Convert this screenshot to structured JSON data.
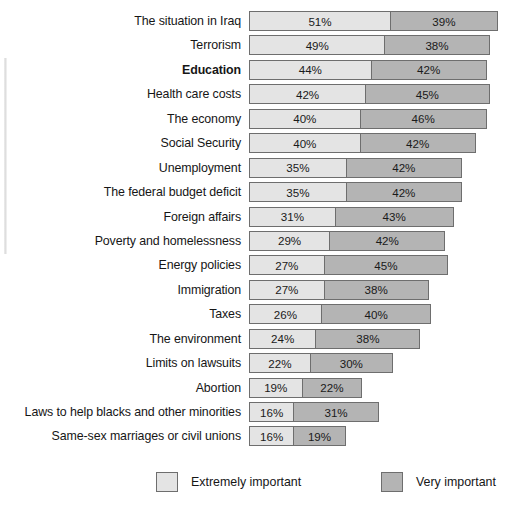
{
  "chart_data": {
    "type": "bar",
    "orientation": "horizontal",
    "stacked": true,
    "title": "",
    "subtitle": "",
    "xlabel": "",
    "ylabel": "",
    "grid": false,
    "legend_position": "bottom",
    "value_suffix": "%",
    "xlim": [
      0,
      95
    ],
    "px_per_percent": 2.765,
    "categories": [
      "The situation in Iraq",
      "Terrorism",
      "Education",
      "Health care costs",
      "The economy",
      "Social Security",
      "Unemployment",
      "The federal budget deficit",
      "Foreign affairs",
      "Poverty and homelessness",
      "Energy policies",
      "Immigration",
      "Taxes",
      "The environment",
      "Limits on lawsuits",
      "Abortion",
      "Laws to help blacks and other minorities",
      "Same-sex marriages or civil unions"
    ],
    "emphasized_category": "Education",
    "series": [
      {
        "name": "Extremely important",
        "color": "#e4e4e4",
        "values": [
          51,
          49,
          44,
          42,
          40,
          40,
          35,
          35,
          31,
          29,
          27,
          27,
          26,
          24,
          22,
          19,
          16,
          16
        ],
        "labels": [
          "51%",
          "49%",
          "44%",
          "42%",
          "40%",
          "40%",
          "35%",
          "35%",
          "31%",
          "29%",
          "27%",
          "27%",
          "26%",
          "24%",
          "22%",
          "19%",
          "16%",
          "16%"
        ]
      },
      {
        "name": "Very important",
        "color": "#b4b4b4",
        "values": [
          39,
          38,
          42,
          45,
          46,
          42,
          42,
          42,
          43,
          42,
          45,
          38,
          40,
          38,
          30,
          22,
          31,
          19
        ],
        "labels": [
          "39%",
          "38%",
          "42%",
          "45%",
          "46%",
          "42%",
          "42%",
          "42%",
          "43%",
          "42%",
          "45%",
          "38%",
          "40%",
          "38%",
          "30%",
          "22%",
          "31%",
          "19%"
        ]
      }
    ],
    "totals": [
      90,
      87,
      86,
      87,
      86,
      82,
      77,
      77,
      74,
      71,
      72,
      65,
      66,
      62,
      52,
      41,
      47,
      35
    ]
  },
  "rows": [
    {
      "label": "The situation in Iraq",
      "emphasis": false,
      "extremely": 51,
      "very": 39,
      "extremely_label": "51%",
      "very_label": "39%"
    },
    {
      "label": "Terrorism",
      "emphasis": false,
      "extremely": 49,
      "very": 38,
      "extremely_label": "49%",
      "very_label": "38%"
    },
    {
      "label": "Education",
      "emphasis": true,
      "extremely": 44,
      "very": 42,
      "extremely_label": "44%",
      "very_label": "42%"
    },
    {
      "label": "Health care costs",
      "emphasis": false,
      "extremely": 42,
      "very": 45,
      "extremely_label": "42%",
      "very_label": "45%"
    },
    {
      "label": "The economy",
      "emphasis": false,
      "extremely": 40,
      "very": 46,
      "extremely_label": "40%",
      "very_label": "46%"
    },
    {
      "label": "Social Security",
      "emphasis": false,
      "extremely": 40,
      "very": 42,
      "extremely_label": "40%",
      "very_label": "42%"
    },
    {
      "label": "Unemployment",
      "emphasis": false,
      "extremely": 35,
      "very": 42,
      "extremely_label": "35%",
      "very_label": "42%"
    },
    {
      "label": "The federal budget deficit",
      "emphasis": false,
      "extremely": 35,
      "very": 42,
      "extremely_label": "35%",
      "very_label": "42%"
    },
    {
      "label": "Foreign affairs",
      "emphasis": false,
      "extremely": 31,
      "very": 43,
      "extremely_label": "31%",
      "very_label": "43%"
    },
    {
      "label": "Poverty and homelessness",
      "emphasis": false,
      "extremely": 29,
      "very": 42,
      "extremely_label": "29%",
      "very_label": "42%"
    },
    {
      "label": "Energy policies",
      "emphasis": false,
      "extremely": 27,
      "very": 45,
      "extremely_label": "27%",
      "very_label": "45%"
    },
    {
      "label": "Immigration",
      "emphasis": false,
      "extremely": 27,
      "very": 38,
      "extremely_label": "27%",
      "very_label": "38%"
    },
    {
      "label": "Taxes",
      "emphasis": false,
      "extremely": 26,
      "very": 40,
      "extremely_label": "26%",
      "very_label": "40%"
    },
    {
      "label": "The environment",
      "emphasis": false,
      "extremely": 24,
      "very": 38,
      "extremely_label": "24%",
      "very_label": "38%"
    },
    {
      "label": "Limits on lawsuits",
      "emphasis": false,
      "extremely": 22,
      "very": 30,
      "extremely_label": "22%",
      "very_label": "30%"
    },
    {
      "label": "Abortion",
      "emphasis": false,
      "extremely": 19,
      "very": 22,
      "extremely_label": "19%",
      "very_label": "22%"
    },
    {
      "label": "Laws to help blacks and other minorities",
      "emphasis": false,
      "extremely": 16,
      "very": 31,
      "extremely_label": "16%",
      "very_label": "31%"
    },
    {
      "label": "Same-sex marriages or civil unions",
      "emphasis": false,
      "extremely": 16,
      "very": 19,
      "extremely_label": "16%",
      "very_label": "19%"
    }
  ],
  "legend": {
    "extremely": {
      "label": "Extremely important",
      "color": "#e4e4e4"
    },
    "very": {
      "label": "Very important",
      "color": "#b4b4b4"
    }
  }
}
